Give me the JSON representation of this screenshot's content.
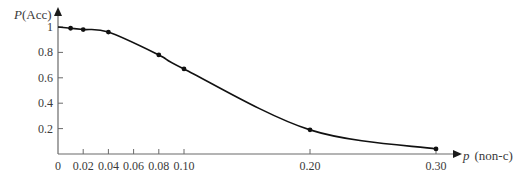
{
  "chart_data": {
    "type": "line",
    "title": "",
    "xlabel": "p (non-c)",
    "xlabel_italic_part": "p",
    "xlabel_rest": "(non-c)",
    "ylabel": "P(Acc)",
    "ylabel_italic_part": "P",
    "ylabel_rest": "(Acc)",
    "x_ticks": [
      "0",
      "0.02",
      "0.04",
      "0.06",
      "0.08",
      "0.10",
      "0.20",
      "0.30"
    ],
    "x_tick_values": [
      0,
      0.02,
      0.04,
      0.06,
      0.08,
      0.1,
      0.2,
      0.3
    ],
    "y_ticks": [
      "0.2",
      "0.4",
      "0.6",
      "0.8",
      "1"
    ],
    "y_tick_values": [
      0.2,
      0.4,
      0.6,
      0.8,
      1.0
    ],
    "xlim": [
      0,
      0.31
    ],
    "ylim": [
      0,
      1.05
    ],
    "grid": false,
    "legend": "none",
    "series": [
      {
        "name": "P(Acc)",
        "x": [
          0,
          0.01,
          0.02,
          0.04,
          0.08,
          0.1,
          0.2,
          0.3
        ],
        "values": [
          1.0,
          0.99,
          0.98,
          0.96,
          0.78,
          0.67,
          0.19,
          0.04
        ],
        "markers_at": [
          0.01,
          0.02,
          0.04,
          0.08,
          0.1,
          0.2,
          0.3
        ]
      }
    ]
  }
}
